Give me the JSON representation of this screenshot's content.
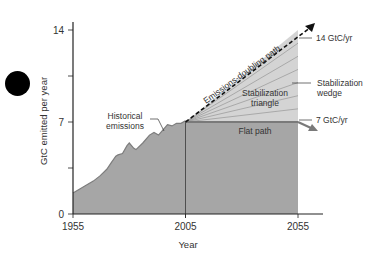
{
  "chart_data": {
    "type": "area",
    "title": "",
    "xlabel": "Year",
    "ylabel": "GtC emitted per year",
    "xlim": [
      1955,
      2055
    ],
    "ylim": [
      0,
      14
    ],
    "x_ticks": [
      1955,
      2005,
      2055
    ],
    "y_ticks": [
      0,
      3.5,
      7,
      10.5,
      14
    ],
    "y_tick_labels": [
      "0",
      "",
      "7",
      "",
      "14"
    ],
    "x_tick_labels": [
      "1955",
      "2005",
      "2055"
    ],
    "grid": false,
    "series": [
      {
        "name": "Historical emissions",
        "x": [
          1955,
          1958,
          1961,
          1964,
          1967,
          1970,
          1972,
          1974,
          1975,
          1977,
          1979,
          1980,
          1982,
          1983,
          1986,
          1989,
          1991,
          1993,
          1995,
          1997,
          1999,
          2001,
          2003,
          2005
        ],
        "values": [
          1.6,
          1.9,
          2.2,
          2.5,
          2.9,
          3.4,
          3.9,
          4.4,
          4.5,
          4.6,
          5.2,
          5.4,
          5.0,
          4.9,
          5.4,
          6.0,
          6.2,
          6.0,
          6.4,
          6.8,
          6.7,
          6.9,
          6.9,
          7.1
        ]
      },
      {
        "name": "Emissions-doubling path",
        "x": [
          2005,
          2055
        ],
        "values": [
          7,
          14
        ],
        "style": "dashed-arrow"
      },
      {
        "name": "Flat path",
        "x": [
          2005,
          2055
        ],
        "values": [
          7,
          7
        ]
      }
    ],
    "wedges": {
      "count": 7,
      "from_year": 2005,
      "to_year": 2055,
      "base_value": 7,
      "top_value": 14
    },
    "annotations": {
      "historical": [
        "Historical",
        "emissions"
      ],
      "doubling": "Emissions-doubling path",
      "triangle": [
        "Stabilization",
        "triangle"
      ],
      "wedge": [
        "Stabilization",
        "wedge"
      ],
      "flat": "Flat path",
      "top_label": "14 GtC/yr",
      "flat_label": "7 GtC/yr"
    },
    "colors": {
      "historical_fill": "#a6a6a6",
      "flat_fill": "#a6a6a6",
      "triangle_fill": "#d4d4d4",
      "wedge_line": "#8c8c8c",
      "flat_line": "#7a7a7a",
      "axis": "#222222"
    }
  }
}
